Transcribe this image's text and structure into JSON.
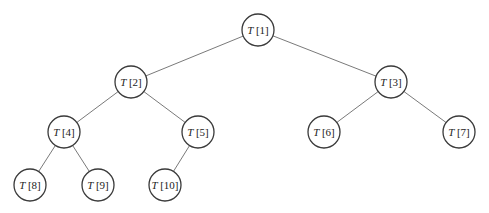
{
  "diagram": {
    "type": "binary-tree",
    "radius": 16,
    "nodes": [
      {
        "id": 1,
        "label_var": "T",
        "label_idx": "[1]",
        "x": 258,
        "y": 30
      },
      {
        "id": 2,
        "label_var": "T",
        "label_idx": "[2]",
        "x": 131,
        "y": 82
      },
      {
        "id": 3,
        "label_var": "T",
        "label_idx": "[3]",
        "x": 391,
        "y": 82
      },
      {
        "id": 4,
        "label_var": "T",
        "label_idx": "[4]",
        "x": 64,
        "y": 132
      },
      {
        "id": 5,
        "label_var": "T",
        "label_idx": "[5]",
        "x": 198,
        "y": 132
      },
      {
        "id": 6,
        "label_var": "T",
        "label_idx": "[6]",
        "x": 324,
        "y": 132
      },
      {
        "id": 7,
        "label_var": "T",
        "label_idx": "[7]",
        "x": 459,
        "y": 132
      },
      {
        "id": 8,
        "label_var": "T",
        "label_idx": "[8]",
        "x": 30,
        "y": 185
      },
      {
        "id": 9,
        "label_var": "T",
        "label_idx": "[9]",
        "x": 98,
        "y": 185
      },
      {
        "id": 10,
        "label_var": "T",
        "label_idx": "[10]",
        "x": 165,
        "y": 185
      }
    ],
    "edges": [
      [
        1,
        2
      ],
      [
        1,
        3
      ],
      [
        2,
        4
      ],
      [
        2,
        5
      ],
      [
        3,
        6
      ],
      [
        3,
        7
      ],
      [
        4,
        8
      ],
      [
        4,
        9
      ],
      [
        5,
        10
      ]
    ]
  }
}
